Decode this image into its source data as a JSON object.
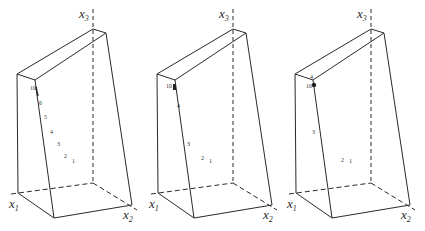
{
  "figure": {
    "panels": [
      {
        "id": "panel-1",
        "offset_x": 0,
        "axes": {
          "x1": "x",
          "x1_sub": "1",
          "x2": "x",
          "x2_sub": "2",
          "x3": "x",
          "x3_sub": "3"
        },
        "points": [
          {
            "label": "1",
            "x": 72,
            "y": 163
          },
          {
            "label": "2",
            "x": 64,
            "y": 158
          },
          {
            "label": "3",
            "x": 57,
            "y": 146
          },
          {
            "label": "4",
            "x": 50,
            "y": 134
          },
          {
            "label": "5",
            "x": 44,
            "y": 119
          },
          {
            "label": "6",
            "x": 39,
            "y": 105
          },
          {
            "label": "10",
            "x": 30,
            "y": 89
          }
        ]
      },
      {
        "id": "panel-2",
        "offset_x": 140,
        "axes": {
          "x1": "x",
          "x1_sub": "1",
          "x2": "x",
          "x2_sub": "2",
          "x3": "x",
          "x3_sub": "3"
        },
        "points": [
          {
            "label": "1",
            "x": 209,
            "y": 163
          },
          {
            "label": "2",
            "x": 201,
            "y": 160
          },
          {
            "label": "3",
            "x": 187,
            "y": 146
          },
          {
            "label": "4",
            "x": 178,
            "y": 108
          },
          {
            "label": "10",
            "x": 167,
            "y": 87
          }
        ]
      },
      {
        "id": "panel-3",
        "offset_x": 279,
        "axes": {
          "x1": "x",
          "x1_sub": "1",
          "x2": "x",
          "x2_sub": "2",
          "x3": "x",
          "x3_sub": "3"
        },
        "points": [
          {
            "label": "1",
            "x": 349,
            "y": 163
          },
          {
            "label": "2",
            "x": 341,
            "y": 162
          },
          {
            "label": "3",
            "x": 313,
            "y": 133
          },
          {
            "label": "4",
            "x": 310,
            "y": 79
          },
          {
            "label": "10",
            "x": 307,
            "y": 87
          }
        ]
      }
    ]
  }
}
